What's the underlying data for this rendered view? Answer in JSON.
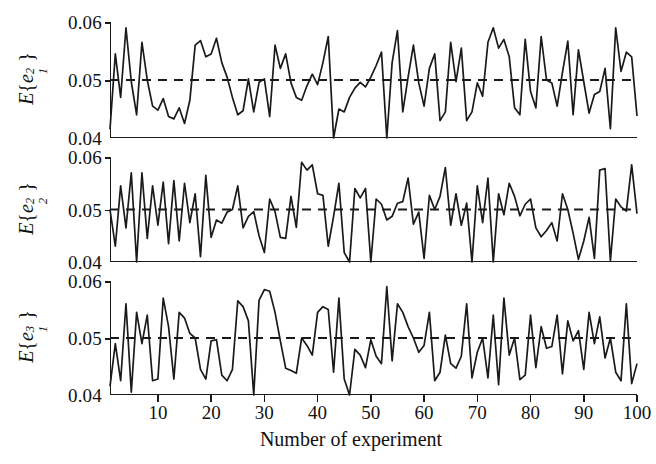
{
  "chart_data": {
    "type": "line",
    "title": "",
    "subtitle": "",
    "xlabel": "Number of experiment",
    "xlim": [
      1,
      100
    ],
    "xticks": [
      10,
      20,
      30,
      40,
      50,
      60,
      70,
      80,
      90,
      100
    ],
    "xticklabels": [
      "10",
      "20",
      "30",
      "40",
      "50",
      "60",
      "70",
      "80",
      "90",
      "100"
    ],
    "grid": false,
    "legend": null,
    "line_color": "#1a1a1a",
    "reference_line": {
      "value": 0.05,
      "style": "dashed",
      "color": "#1a1a1a"
    },
    "panels": [
      {
        "ylabel": "E {e₁²}",
        "ylabel_parts": {
          "fn": "E",
          "open": "{",
          "var": "e",
          "sup": "2",
          "sub": "1",
          "close": "}"
        },
        "ylim": [
          0.04,
          0.06
        ],
        "yticks": [
          0.04,
          0.05,
          0.06
        ],
        "yticklabels": [
          "0.04",
          "0.05",
          "0.06"
        ],
        "x": [
          1,
          2,
          3,
          4,
          5,
          6,
          7,
          8,
          9,
          10,
          11,
          12,
          13,
          14,
          15,
          16,
          17,
          18,
          19,
          20,
          21,
          22,
          23,
          24,
          25,
          26,
          27,
          28,
          29,
          30,
          31,
          32,
          33,
          34,
          35,
          36,
          37,
          38,
          39,
          40,
          41,
          42,
          43,
          44,
          45,
          46,
          47,
          48,
          49,
          50,
          51,
          52,
          53,
          54,
          55,
          56,
          57,
          58,
          59,
          60,
          61,
          62,
          63,
          64,
          65,
          66,
          67,
          68,
          69,
          70,
          71,
          72,
          73,
          74,
          75,
          76,
          77,
          78,
          79,
          80,
          81,
          82,
          83,
          84,
          85,
          86,
          87,
          88,
          89,
          90,
          91,
          92,
          93,
          94,
          95,
          96,
          97,
          98,
          99,
          100
        ],
        "values": [
          0.0415,
          0.0545,
          0.047,
          0.059,
          0.0497,
          0.044,
          0.0565,
          0.05,
          0.0455,
          0.0448,
          0.0468,
          0.0437,
          0.0433,
          0.0452,
          0.0425,
          0.0465,
          0.056,
          0.0568,
          0.054,
          0.0545,
          0.0572,
          0.053,
          0.0505,
          0.047,
          0.044,
          0.0447,
          0.0502,
          0.0445,
          0.0496,
          0.0502,
          0.0437,
          0.056,
          0.052,
          0.0545,
          0.0495,
          0.047,
          0.0465,
          0.049,
          0.051,
          0.0492,
          0.053,
          0.0575,
          0.04,
          0.045,
          0.0445,
          0.047,
          0.0486,
          0.0496,
          0.0488,
          0.0505,
          0.0525,
          0.0548,
          0.04,
          0.053,
          0.0585,
          0.0445,
          0.0505,
          0.056,
          0.0495,
          0.0455,
          0.052,
          0.0545,
          0.043,
          0.0445,
          0.0565,
          0.0497,
          0.0555,
          0.043,
          0.0445,
          0.0495,
          0.0472,
          0.0565,
          0.059,
          0.0555,
          0.057,
          0.054,
          0.0452,
          0.044,
          0.057,
          0.048,
          0.0452,
          0.0575,
          0.05,
          0.0495,
          0.0455,
          0.0513,
          0.0567,
          0.044,
          0.0552,
          0.0497,
          0.0443,
          0.0475,
          0.048,
          0.052,
          0.0416,
          0.059,
          0.0515,
          0.0548,
          0.054,
          0.0438,
          0.0446,
          0.0525,
          0.0494,
          0.0455,
          0.0512,
          0.05,
          0.0455,
          0.0595,
          0.0478,
          0.044,
          0.052,
          0.05
        ]
      },
      {
        "ylabel": "E {e₂²}",
        "ylabel_parts": {
          "fn": "E",
          "open": "{",
          "var": "e",
          "sup": "2",
          "sub": "2",
          "close": "}"
        },
        "ylim": [
          0.04,
          0.06
        ],
        "yticks": [
          0.04,
          0.05,
          0.06
        ],
        "yticklabels": [
          "0.04",
          "0.05",
          "0.06"
        ],
        "x": [
          1,
          2,
          3,
          4,
          5,
          6,
          7,
          8,
          9,
          10,
          11,
          12,
          13,
          14,
          15,
          16,
          17,
          18,
          19,
          20,
          21,
          22,
          23,
          24,
          25,
          26,
          27,
          28,
          29,
          30,
          31,
          32,
          33,
          34,
          35,
          36,
          37,
          38,
          39,
          40,
          41,
          42,
          43,
          44,
          45,
          46,
          47,
          48,
          49,
          50,
          51,
          52,
          53,
          54,
          55,
          56,
          57,
          58,
          59,
          60,
          61,
          62,
          63,
          64,
          65,
          66,
          67,
          68,
          69,
          70,
          71,
          72,
          73,
          74,
          75,
          76,
          77,
          78,
          79,
          80,
          81,
          82,
          83,
          84,
          85,
          86,
          87,
          88,
          89,
          90,
          91,
          92,
          93,
          94,
          95,
          96,
          97,
          98,
          99,
          100
        ],
        "values": [
          0.05,
          0.043,
          0.0545,
          0.0465,
          0.057,
          0.04,
          0.057,
          0.0445,
          0.0545,
          0.047,
          0.0552,
          0.0435,
          0.0555,
          0.044,
          0.055,
          0.0475,
          0.053,
          0.041,
          0.0565,
          0.0447,
          0.048,
          0.0474,
          0.0495,
          0.05,
          0.0545,
          0.0465,
          0.0487,
          0.0496,
          0.045,
          0.0418,
          0.052,
          0.0496,
          0.0447,
          0.0445,
          0.0525,
          0.0466,
          0.059,
          0.0575,
          0.0585,
          0.053,
          0.0527,
          0.043,
          0.0487,
          0.055,
          0.0418,
          0.04,
          0.054,
          0.0522,
          0.054,
          0.04,
          0.052,
          0.051,
          0.048,
          0.0487,
          0.0512,
          0.0515,
          0.056,
          0.0472,
          0.0495,
          0.0407,
          0.0527,
          0.05,
          0.0525,
          0.058,
          0.047,
          0.053,
          0.047,
          0.0512,
          0.04,
          0.0545,
          0.0475,
          0.056,
          0.04,
          0.053,
          0.049,
          0.055,
          0.0525,
          0.0488,
          0.051,
          0.052,
          0.0465,
          0.0448,
          0.046,
          0.0475,
          0.044,
          0.053,
          0.05,
          0.0455,
          0.0405,
          0.044,
          0.0485,
          0.0407,
          0.0575,
          0.0578,
          0.0402,
          0.052,
          0.0505,
          0.0497,
          0.0585,
          0.0492
        ]
      },
      {
        "ylabel": "E {e₁³}",
        "ylabel_parts": {
          "fn": "E",
          "open": "{",
          "var": "e",
          "sup": "3",
          "sub": "1",
          "close": "}"
        },
        "ylim": [
          0.04,
          0.06
        ],
        "yticks": [
          0.04,
          0.05,
          0.06
        ],
        "yticklabels": [
          "0.04",
          "0.05",
          "0.06"
        ],
        "x": [
          1,
          2,
          3,
          4,
          5,
          6,
          7,
          8,
          9,
          10,
          11,
          12,
          13,
          14,
          15,
          16,
          17,
          18,
          19,
          20,
          21,
          22,
          23,
          24,
          25,
          26,
          27,
          28,
          29,
          30,
          31,
          32,
          33,
          34,
          35,
          36,
          37,
          38,
          39,
          40,
          41,
          42,
          43,
          44,
          45,
          46,
          47,
          48,
          49,
          50,
          51,
          52,
          53,
          54,
          55,
          56,
          57,
          58,
          59,
          60,
          61,
          62,
          63,
          64,
          65,
          66,
          67,
          68,
          69,
          70,
          71,
          72,
          73,
          74,
          75,
          76,
          77,
          78,
          79,
          80,
          81,
          82,
          83,
          84,
          85,
          86,
          87,
          88,
          89,
          90,
          91,
          92,
          93,
          94,
          95,
          96,
          97,
          98,
          99,
          100
        ],
        "values": [
          0.0415,
          0.049,
          0.0425,
          0.056,
          0.0405,
          0.0545,
          0.049,
          0.054,
          0.0425,
          0.0428,
          0.057,
          0.052,
          0.0428,
          0.0545,
          0.0535,
          0.0508,
          0.05,
          0.0445,
          0.0428,
          0.0495,
          0.0497,
          0.0435,
          0.0425,
          0.0445,
          0.0565,
          0.0555,
          0.053,
          0.04,
          0.0566,
          0.0585,
          0.0582,
          0.0545,
          0.0495,
          0.0447,
          0.0443,
          0.0438,
          0.05,
          0.0487,
          0.047,
          0.0545,
          0.0555,
          0.055,
          0.044,
          0.057,
          0.0428,
          0.04,
          0.048,
          0.047,
          0.0448,
          0.0497,
          0.0468,
          0.0455,
          0.059,
          0.046,
          0.056,
          0.0545,
          0.052,
          0.05,
          0.0475,
          0.0487,
          0.0545,
          0.0425,
          0.044,
          0.0505,
          0.0455,
          0.0447,
          0.0468,
          0.056,
          0.043,
          0.0475,
          0.05,
          0.043,
          0.054,
          0.0418,
          0.057,
          0.047,
          0.05,
          0.0427,
          0.0435,
          0.054,
          0.0448,
          0.052,
          0.0482,
          0.0485,
          0.054,
          0.0437,
          0.053,
          0.0495,
          0.0513,
          0.0445,
          0.0545,
          0.049,
          0.0537,
          0.0465,
          0.05,
          0.044,
          0.0425,
          0.056,
          0.042,
          0.0455
        ]
      }
    ]
  }
}
